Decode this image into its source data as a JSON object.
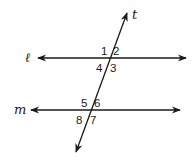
{
  "diagram": {
    "lines": {
      "l": {
        "label": "ℓ",
        "type": "line"
      },
      "m": {
        "label": "m",
        "type": "line"
      },
      "t": {
        "label": "t",
        "type": "transversal"
      }
    },
    "angles": {
      "a1": "1",
      "a2": "2",
      "a3": "3",
      "a4": "4",
      "a5": "5",
      "a6": "6",
      "a7": "7",
      "a8": "8"
    },
    "intersections": [
      {
        "lines": [
          "ℓ",
          "t"
        ],
        "angles": [
          "1",
          "2",
          "3",
          "4"
        ]
      },
      {
        "lines": [
          "m",
          "t"
        ],
        "angles": [
          "5",
          "6",
          "7",
          "8"
        ]
      }
    ],
    "colors": {
      "stroke": "#1a1a1a",
      "background": "#ffffff"
    }
  }
}
